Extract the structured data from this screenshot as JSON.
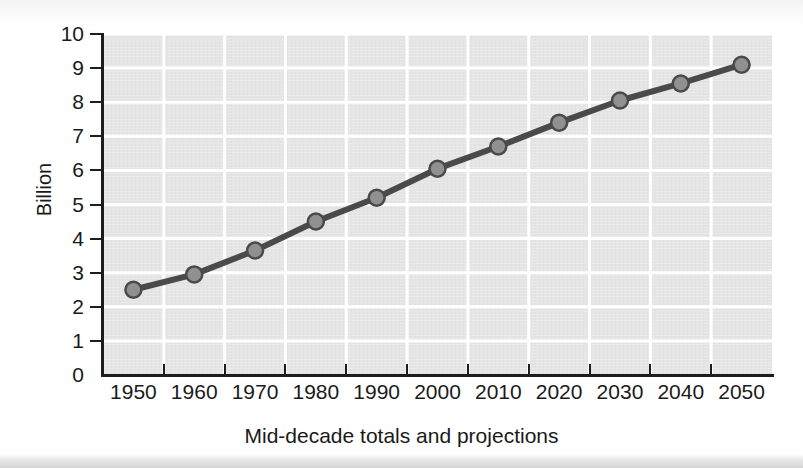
{
  "chart_data": {
    "type": "line",
    "title": "",
    "subtitle": "",
    "xlabel": "Mid-decade totals and projections",
    "ylabel": "Billion",
    "categories": [
      "1950",
      "1960",
      "1970",
      "1980",
      "1990",
      "2000",
      "2010",
      "2020",
      "2030",
      "2040",
      "2050"
    ],
    "values": [
      2.5,
      2.95,
      3.65,
      4.5,
      5.2,
      6.05,
      6.7,
      7.4,
      8.05,
      8.55,
      9.1
    ],
    "series": [
      {
        "name": "World population",
        "values": [
          2.5,
          2.95,
          3.65,
          4.5,
          5.2,
          6.05,
          6.7,
          7.4,
          8.05,
          8.55,
          9.1
        ]
      }
    ],
    "ylim": [
      0,
      10
    ],
    "y_ticks": [
      "0",
      "1",
      "2",
      "3",
      "4",
      "5",
      "6",
      "7",
      "8",
      "9",
      "10"
    ],
    "x_ticks": [
      "1950",
      "1960",
      "1970",
      "1980",
      "1990",
      "2000",
      "2010",
      "2020",
      "2030",
      "2040",
      "2050"
    ],
    "grid": true,
    "grid_color": "#ffffff",
    "legend": "none",
    "plot_background": "#e4e4e4",
    "line_color": "#4a4a4a",
    "marker_color": "#909090",
    "marker_edge_color": "#4a4a4a",
    "axis_color": "#1d1d1d"
  },
  "figure": {
    "page_background": "#ffffff"
  }
}
